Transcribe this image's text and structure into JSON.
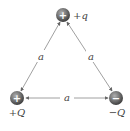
{
  "diagram": {
    "charges": [
      {
        "id": "top",
        "sign": "+",
        "label": "+q"
      },
      {
        "id": "bottom-left",
        "sign": "+",
        "label": "+Q"
      },
      {
        "id": "bottom-right",
        "sign": "−",
        "label": "−Q"
      }
    ],
    "sides": [
      {
        "between": [
          "top",
          "bottom-left"
        ],
        "label": "a"
      },
      {
        "between": [
          "top",
          "bottom-right"
        ],
        "label": "a"
      },
      {
        "between": [
          "bottom-left",
          "bottom-right"
        ],
        "label": "a"
      }
    ],
    "colors": {
      "charge_fill": "#6e6e6e",
      "line": "#888888",
      "text": "#444444"
    }
  }
}
